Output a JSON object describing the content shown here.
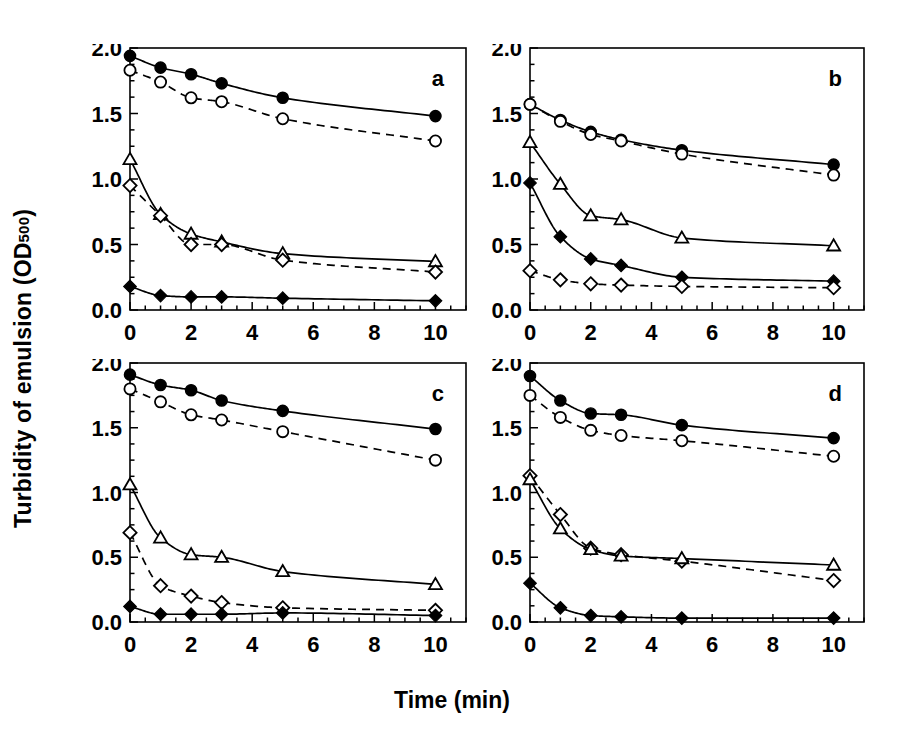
{
  "figure": {
    "xlabel": "Time (min)",
    "ylabel_main": "Turbidity of emulsion (OD",
    "ylabel_sub": "500",
    "ylabel_close": ")"
  },
  "chart_data": {
    "type": "line",
    "title": "",
    "xlabel": "Time (min)",
    "ylabel": "Turbidity of emulsion (OD500)",
    "xlim": [
      0,
      11
    ],
    "ylim": [
      0.0,
      2.0
    ],
    "xticks": [
      0,
      2,
      4,
      6,
      8,
      10
    ],
    "xtick_labels": [
      "0",
      "2",
      "4",
      "6",
      "8",
      "10"
    ],
    "yticks": [
      0.0,
      0.5,
      1.0,
      1.5,
      2.0
    ],
    "ytick_labels": [
      "0.0",
      "0.5",
      "1.0",
      "1.5",
      "2.0"
    ],
    "grid": false,
    "legend": "none",
    "x": [
      0,
      1,
      2,
      3,
      5,
      10
    ],
    "markers": {
      "filled-circle": "solid line, filled circle",
      "open-circle": "dashed line, open circle",
      "open-triangle": "solid line, open triangle",
      "open-diamond": "dashed line, open diamond",
      "filled-diamond": "solid line, filled diamond"
    },
    "panels": [
      {
        "label": "a",
        "series": [
          {
            "name": "filled-circle",
            "marker": "filled-circle",
            "line": "solid",
            "values": [
              1.94,
              1.85,
              1.8,
              1.73,
              1.62,
              1.48
            ]
          },
          {
            "name": "open-circle",
            "marker": "open-circle",
            "line": "dashed",
            "values": [
              1.83,
              1.74,
              1.62,
              1.59,
              1.46,
              1.29
            ]
          },
          {
            "name": "open-triangle",
            "marker": "open-triangle",
            "line": "solid",
            "values": [
              1.15,
              0.73,
              0.58,
              0.52,
              0.43,
              0.37
            ]
          },
          {
            "name": "open-diamond",
            "marker": "open-diamond",
            "line": "dashed",
            "values": [
              0.95,
              0.72,
              0.5,
              0.5,
              0.38,
              0.29
            ]
          },
          {
            "name": "filled-diamond",
            "marker": "filled-diamond",
            "line": "solid",
            "values": [
              0.18,
              0.11,
              0.1,
              0.1,
              0.09,
              0.07
            ]
          }
        ]
      },
      {
        "label": "b",
        "series": [
          {
            "name": "filled-circle",
            "marker": "filled-circle",
            "line": "solid",
            "values": [
              1.57,
              1.45,
              1.36,
              1.3,
              1.22,
              1.11
            ]
          },
          {
            "name": "open-circle",
            "marker": "open-circle",
            "line": "dashed",
            "values": [
              1.57,
              1.44,
              1.34,
              1.29,
              1.19,
              1.03
            ]
          },
          {
            "name": "open-triangle",
            "marker": "open-triangle",
            "line": "solid",
            "values": [
              1.28,
              0.96,
              0.72,
              0.69,
              0.55,
              0.49
            ]
          },
          {
            "name": "filled-diamond",
            "marker": "filled-diamond",
            "line": "solid",
            "values": [
              0.97,
              0.56,
              0.39,
              0.34,
              0.25,
              0.22
            ]
          },
          {
            "name": "open-diamond",
            "marker": "open-diamond",
            "line": "dashed",
            "values": [
              0.3,
              0.23,
              0.2,
              0.19,
              0.18,
              0.17
            ]
          }
        ]
      },
      {
        "label": "c",
        "series": [
          {
            "name": "filled-circle",
            "marker": "filled-circle",
            "line": "solid",
            "values": [
              1.91,
              1.83,
              1.79,
              1.71,
              1.63,
              1.49
            ]
          },
          {
            "name": "open-circle",
            "marker": "open-circle",
            "line": "dashed",
            "values": [
              1.8,
              1.7,
              1.6,
              1.56,
              1.47,
              1.25
            ]
          },
          {
            "name": "open-triangle",
            "marker": "open-triangle",
            "line": "solid",
            "values": [
              1.06,
              0.65,
              0.52,
              0.5,
              0.39,
              0.29
            ]
          },
          {
            "name": "open-diamond",
            "marker": "open-diamond",
            "line": "dashed",
            "values": [
              0.69,
              0.28,
              0.2,
              0.15,
              0.11,
              0.09
            ]
          },
          {
            "name": "filled-diamond",
            "marker": "filled-diamond",
            "line": "solid",
            "values": [
              0.12,
              0.06,
              0.06,
              0.06,
              0.07,
              0.05
            ]
          }
        ]
      },
      {
        "label": "d",
        "series": [
          {
            "name": "filled-circle",
            "marker": "filled-circle",
            "line": "solid",
            "values": [
              1.9,
              1.71,
              1.61,
              1.6,
              1.52,
              1.42
            ]
          },
          {
            "name": "open-circle",
            "marker": "open-circle",
            "line": "dashed",
            "values": [
              1.75,
              1.58,
              1.48,
              1.44,
              1.4,
              1.28
            ]
          },
          {
            "name": "open-diamond",
            "marker": "open-diamond",
            "line": "dashed",
            "values": [
              1.13,
              0.83,
              0.57,
              0.52,
              0.47,
              0.32
            ]
          },
          {
            "name": "open-triangle",
            "marker": "open-triangle",
            "line": "solid",
            "values": [
              1.1,
              0.72,
              0.56,
              0.51,
              0.49,
              0.44
            ]
          },
          {
            "name": "filled-diamond",
            "marker": "filled-diamond",
            "line": "solid",
            "values": [
              0.3,
              0.11,
              0.05,
              0.04,
              0.03,
              0.03
            ]
          }
        ]
      }
    ],
    "panel_geometry": [
      {
        "label": "a",
        "left": 130,
        "top": 48,
        "right": 466,
        "bottom": 310,
        "show_xticklabels": true,
        "show_yticklabels": true
      },
      {
        "label": "b",
        "left": 530,
        "top": 48,
        "right": 864,
        "bottom": 310,
        "show_xticklabels": true,
        "show_yticklabels": true
      },
      {
        "label": "c",
        "left": 130,
        "top": 363,
        "right": 466,
        "bottom": 622,
        "show_xticklabels": true,
        "show_yticklabels": true
      },
      {
        "label": "d",
        "left": 530,
        "top": 363,
        "right": 864,
        "bottom": 622,
        "show_xticklabels": true,
        "show_yticklabels": true
      }
    ]
  }
}
